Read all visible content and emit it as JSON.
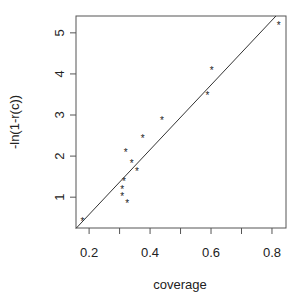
{
  "chart_data": {
    "type": "scatter",
    "title": "",
    "xlabel": "coverage",
    "ylabel": "-ln(1-r(c))",
    "xlim": [
      0.157,
      0.846
    ],
    "ylim": [
      0.25,
      5.41
    ],
    "xticks": [
      0.2,
      0.4,
      0.6,
      0.8
    ],
    "xtick_labels": [
      "0.2",
      "0.4",
      "0.6",
      "0.8"
    ],
    "xminor_ticks": [
      0.3,
      0.5,
      0.7
    ],
    "yticks": [
      1,
      2,
      3,
      4,
      5
    ],
    "ytick_labels": [
      "1",
      "2",
      "3",
      "4",
      "5"
    ],
    "grid": false,
    "legend": null,
    "marker": "*",
    "series": [
      {
        "name": "observations",
        "type": "scatter",
        "points": [
          {
            "x": 0.178,
            "y": 0.42
          },
          {
            "x": 0.325,
            "y": 0.86
          },
          {
            "x": 0.309,
            "y": 1.03
          },
          {
            "x": 0.309,
            "y": 1.2
          },
          {
            "x": 0.314,
            "y": 1.4
          },
          {
            "x": 0.357,
            "y": 1.63
          },
          {
            "x": 0.34,
            "y": 1.84
          },
          {
            "x": 0.32,
            "y": 2.1
          },
          {
            "x": 0.376,
            "y": 2.45
          },
          {
            "x": 0.439,
            "y": 2.88
          },
          {
            "x": 0.588,
            "y": 3.48
          },
          {
            "x": 0.602,
            "y": 4.1
          },
          {
            "x": 0.822,
            "y": 5.2
          }
        ]
      },
      {
        "name": "fitted line",
        "type": "line",
        "points": [
          {
            "x": 0.157,
            "y": 0.24
          },
          {
            "x": 0.813,
            "y": 5.41
          }
        ]
      }
    ]
  },
  "colors": {
    "axis": "#555555",
    "points": "#222222",
    "line": "#333333",
    "text": "#222222"
  }
}
